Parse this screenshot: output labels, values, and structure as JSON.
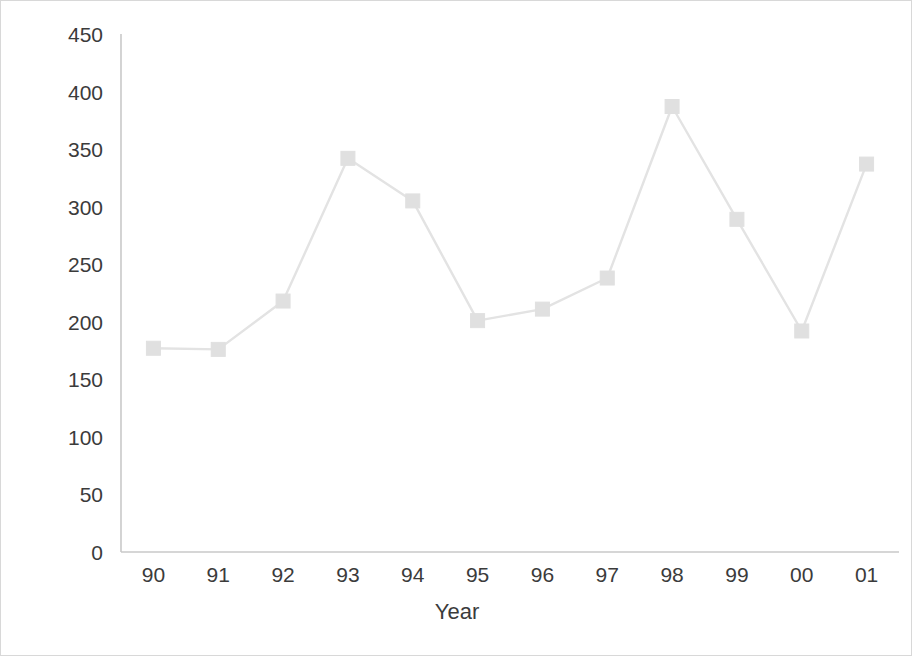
{
  "chart_data": {
    "type": "line",
    "title": "",
    "xlabel": "Year",
    "ylabel": "Protest events",
    "categories": [
      "90",
      "91",
      "92",
      "93",
      "94",
      "95",
      "96",
      "97",
      "98",
      "99",
      "00",
      "01"
    ],
    "values": [
      177,
      176,
      218,
      342,
      305,
      201,
      211,
      238,
      387,
      289,
      192,
      337
    ],
    "series": [
      {
        "name": "Protest events",
        "values": [
          177,
          176,
          218,
          342,
          305,
          201,
          211,
          238,
          387,
          289,
          192,
          337
        ]
      }
    ],
    "ylim": [
      0,
      450
    ],
    "yticks": [
      0,
      50,
      100,
      150,
      200,
      250,
      300,
      350,
      400,
      450
    ],
    "xticks": [
      "90",
      "91",
      "92",
      "93",
      "94",
      "95",
      "96",
      "97",
      "98",
      "99",
      "00",
      "01"
    ],
    "grid": false,
    "legend": false,
    "legend_position": "none",
    "marker": "square",
    "line_color": "#e3e3e3",
    "marker_color": "#e0e0e0",
    "axis_color": "#bfbfbf",
    "text_color": "#3b3b3b"
  }
}
